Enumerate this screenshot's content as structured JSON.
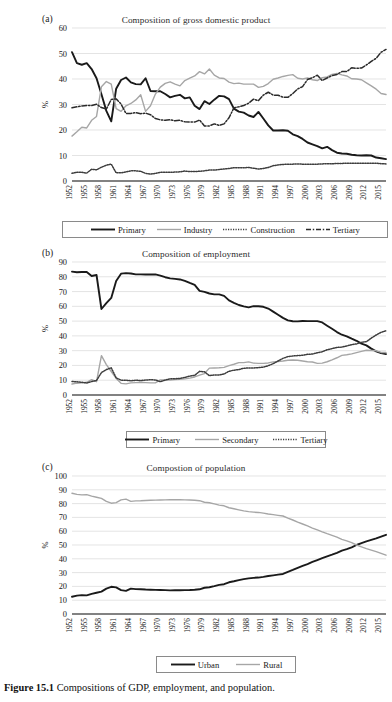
{
  "figure": {
    "caption_label": "Figure 15.1",
    "caption_text": "Compositions of GDP, employment, and population.",
    "axis_percent_label": "%"
  },
  "colors": {
    "primary_line": "#1a1a1a",
    "secondary_line": "#a6a6a6",
    "dotted_line": "#3d3d3d",
    "dashdot_line": "#2b2b2b",
    "gridline": "#d9d9d9",
    "axis": "#595959",
    "background": "#ffffff"
  },
  "panels": [
    {
      "label": "(a)",
      "title": "Composition of gross domestic product",
      "legend": [
        {
          "name": "Primary",
          "style": "solid-black"
        },
        {
          "name": "Industry",
          "style": "solid-gray"
        },
        {
          "name": "Construction",
          "style": "dotted"
        },
        {
          "name": "Tertiary",
          "style": "dash-dot"
        }
      ]
    },
    {
      "label": "(b)",
      "title": "Composition of employment",
      "legend": [
        {
          "name": "Primary",
          "style": "solid-black"
        },
        {
          "name": "Secondary",
          "style": "solid-gray"
        },
        {
          "name": "Tertiary",
          "style": "dotted"
        }
      ]
    },
    {
      "label": "(c)",
      "title": "Compostion of population",
      "legend": [
        {
          "name": "Urban",
          "style": "solid-black"
        },
        {
          "name": "Rural",
          "style": "solid-gray"
        }
      ]
    }
  ],
  "chart_data": [
    {
      "panel": "(a)",
      "type": "line",
      "title": "Composition of gross domestic product",
      "xlabel": "",
      "ylabel": "%",
      "ylim": [
        0,
        60
      ],
      "yticks": [
        0,
        10,
        20,
        30,
        40,
        50,
        60
      ],
      "grid": true,
      "legend_position": "bottom",
      "xtick_labels": [
        "1952",
        "1955",
        "1958",
        "1961",
        "1964",
        "1967",
        "1970",
        "1973",
        "1976",
        "1979",
        "1982",
        "1985",
        "1988",
        "1991",
        "1994",
        "1997",
        "2000",
        "2003",
        "2006",
        "2009",
        "2012",
        "2015"
      ],
      "x": [
        1952,
        1953,
        1954,
        1955,
        1956,
        1957,
        1958,
        1959,
        1960,
        1961,
        1962,
        1963,
        1964,
        1965,
        1966,
        1967,
        1968,
        1969,
        1970,
        1971,
        1972,
        1973,
        1974,
        1975,
        1976,
        1977,
        1978,
        1979,
        1980,
        1981,
        1982,
        1983,
        1984,
        1985,
        1986,
        1987,
        1988,
        1989,
        1990,
        1991,
        1992,
        1993,
        1994,
        1995,
        1996,
        1997,
        1998,
        1999,
        2000,
        2001,
        2002,
        2003,
        2004,
        2005,
        2006,
        2007,
        2008,
        2009,
        2010,
        2011,
        2012,
        2013,
        2014,
        2015,
        2016
      ],
      "series": [
        {
          "name": "Primary",
          "style": "solid-black",
          "values": [
            50.5,
            46.2,
            45.6,
            46.2,
            43.9,
            40.3,
            34.0,
            27.5,
            23.4,
            36.2,
            39.6,
            40.6,
            38.7,
            38.0,
            37.9,
            40.3,
            35.3,
            35.2,
            35.2,
            34.1,
            32.8,
            33.4,
            33.8,
            32.4,
            32.8,
            29.5,
            28.2,
            31.3,
            30.2,
            31.9,
            33.4,
            33.2,
            32.1,
            28.4,
            27.2,
            26.8,
            25.7,
            25.1,
            27.1,
            24.5,
            21.8,
            19.8,
            19.8,
            19.9,
            19.7,
            18.3,
            17.6,
            16.5,
            15.1,
            14.4,
            13.7,
            12.8,
            13.4,
            12.1,
            11.1,
            10.8,
            10.7,
            10.3,
            10.1,
            10.0,
            10.1,
            10.0,
            9.2,
            8.9,
            8.6
          ]
        },
        {
          "name": "Industry",
          "style": "solid-gray",
          "values": [
            17.6,
            19.3,
            21.1,
            20.8,
            23.8,
            25.3,
            37.0,
            39.0,
            38.0,
            28.4,
            27.3,
            29.5,
            30.4,
            31.8,
            33.8,
            27.3,
            29.5,
            34.1,
            36.8,
            38.3,
            38.9,
            38.0,
            37.3,
            39.4,
            40.3,
            41.2,
            42.9,
            42.0,
            43.9,
            41.5,
            40.4,
            40.2,
            38.8,
            38.2,
            38.4,
            38.0,
            38.0,
            38.0,
            36.7,
            37.1,
            38.2,
            39.9,
            40.4,
            41.0,
            41.4,
            41.7,
            40.3,
            40.0,
            40.4,
            39.7,
            39.4,
            40.5,
            40.8,
            41.8,
            42.2,
            41.6,
            41.2,
            40.1,
            40.0,
            39.7,
            38.5,
            37.3,
            36.0,
            34.3,
            33.9
          ]
        },
        {
          "name": "Construction",
          "style": "dotted",
          "values": [
            3.0,
            3.4,
            3.4,
            3.1,
            4.6,
            4.4,
            5.4,
            6.2,
            6.6,
            3.2,
            3.2,
            3.6,
            4.0,
            4.0,
            3.8,
            3.0,
            2.7,
            3.0,
            3.4,
            3.4,
            3.4,
            3.5,
            3.6,
            3.9,
            3.7,
            3.7,
            3.8,
            4.0,
            4.3,
            4.3,
            4.5,
            4.7,
            4.9,
            5.2,
            5.2,
            5.2,
            5.3,
            5.0,
            4.7,
            4.9,
            5.3,
            6.0,
            6.3,
            6.5,
            6.6,
            6.6,
            6.7,
            6.6,
            6.6,
            6.6,
            6.6,
            6.7,
            6.8,
            6.7,
            6.9,
            6.9,
            7.0,
            7.0,
            7.0,
            7.0,
            7.0,
            7.0,
            7.0,
            6.8,
            6.7
          ]
        },
        {
          "name": "Tertiary",
          "style": "dash-dot",
          "values": [
            28.7,
            29.1,
            29.4,
            29.6,
            29.6,
            30.1,
            28.8,
            28.2,
            32.0,
            32.2,
            30.2,
            26.5,
            26.5,
            26.8,
            26.4,
            26.6,
            26.0,
            24.5,
            24.0,
            23.8,
            24.0,
            23.6,
            23.8,
            23.2,
            23.1,
            23.1,
            23.9,
            21.6,
            21.6,
            22.4,
            21.8,
            22.4,
            24.8,
            28.7,
            29.1,
            29.6,
            30.5,
            32.1,
            31.5,
            33.7,
            34.8,
            33.7,
            33.6,
            32.9,
            32.8,
            34.3,
            36.1,
            37.0,
            39.8,
            40.5,
            41.5,
            39.4,
            40.4,
            41.3,
            41.8,
            42.9,
            42.9,
            44.4,
            44.2,
            44.3,
            45.5,
            46.9,
            48.1,
            50.5,
            51.6
          ]
        }
      ]
    },
    {
      "panel": "(b)",
      "type": "line",
      "title": "Composition of employment",
      "xlabel": "",
      "ylabel": "%",
      "ylim": [
        0,
        90
      ],
      "yticks": [
        0,
        10,
        20,
        30,
        40,
        50,
        60,
        70,
        80,
        90
      ],
      "grid": true,
      "legend_position": "bottom",
      "xtick_labels": [
        "1952",
        "1955",
        "1958",
        "1961",
        "1964",
        "1967",
        "1970",
        "1973",
        "1976",
        "1979",
        "1982",
        "1985",
        "1988",
        "1991",
        "1994",
        "1997",
        "2000",
        "2003",
        "2006",
        "2009",
        "2012",
        "2015"
      ],
      "x": [
        1952,
        1953,
        1954,
        1955,
        1956,
        1957,
        1958,
        1959,
        1960,
        1961,
        1962,
        1963,
        1964,
        1965,
        1966,
        1967,
        1968,
        1969,
        1970,
        1971,
        1972,
        1973,
        1974,
        1975,
        1976,
        1977,
        1978,
        1979,
        1980,
        1981,
        1982,
        1983,
        1984,
        1985,
        1986,
        1987,
        1988,
        1989,
        1990,
        1991,
        1992,
        1993,
        1994,
        1995,
        1996,
        1997,
        1998,
        1999,
        2000,
        2001,
        2002,
        2003,
        2004,
        2005,
        2006,
        2007,
        2008,
        2009,
        2010,
        2011,
        2012,
        2013,
        2014,
        2015,
        2016
      ],
      "series": [
        {
          "name": "Primary",
          "style": "solid-black",
          "values": [
            83.5,
            83.1,
            83.2,
            83.3,
            80.5,
            81.2,
            58.2,
            62.2,
            65.7,
            77.2,
            82.1,
            82.5,
            82.2,
            81.6,
            81.6,
            81.5,
            81.5,
            81.6,
            80.8,
            79.7,
            78.9,
            78.6,
            78.2,
            77.2,
            75.8,
            74.5,
            70.5,
            69.8,
            68.7,
            68.1,
            68.1,
            67.1,
            64.0,
            62.4,
            60.9,
            60.0,
            59.3,
            60.1,
            60.1,
            59.7,
            58.5,
            56.4,
            54.3,
            52.2,
            50.5,
            49.9,
            49.8,
            50.1,
            50.0,
            50.0,
            50.0,
            49.1,
            46.9,
            44.8,
            42.6,
            40.8,
            39.6,
            38.1,
            36.7,
            34.8,
            33.6,
            31.4,
            29.5,
            28.3,
            27.7
          ]
        },
        {
          "name": "Secondary",
          "style": "solid-gray",
          "values": [
            7.4,
            8.0,
            8.2,
            8.6,
            10.4,
            9.0,
            26.6,
            20.6,
            15.9,
            11.2,
            7.9,
            7.5,
            8.2,
            8.4,
            8.6,
            8.4,
            8.2,
            8.2,
            10.2,
            10.2,
            10.1,
            10.4,
            10.6,
            10.9,
            11.4,
            12.2,
            13.5,
            14.5,
            18.2,
            18.3,
            18.4,
            18.7,
            19.9,
            20.8,
            21.9,
            21.9,
            22.4,
            21.6,
            21.4,
            21.4,
            21.7,
            22.4,
            22.7,
            23.0,
            23.5,
            23.7,
            23.5,
            23.0,
            22.5,
            22.3,
            21.4,
            21.6,
            22.5,
            23.8,
            25.2,
            26.8,
            27.2,
            27.8,
            28.7,
            29.5,
            30.3,
            30.1,
            29.9,
            28.8,
            28.8
          ]
        },
        {
          "name": "Tertiary",
          "style": "dotted",
          "values": [
            9.1,
            8.9,
            8.6,
            8.1,
            9.1,
            9.8,
            15.2,
            17.2,
            18.4,
            11.6,
            10.0,
            10.0,
            9.6,
            10.0,
            9.8,
            10.1,
            10.3,
            10.2,
            9.0,
            10.1,
            11.0,
            11.0,
            11.2,
            11.9,
            12.8,
            13.3,
            16.0,
            15.7,
            13.1,
            13.6,
            13.5,
            14.2,
            16.1,
            16.8,
            17.2,
            18.1,
            18.3,
            18.3,
            18.5,
            18.9,
            19.8,
            21.2,
            23.0,
            24.8,
            26.0,
            26.4,
            26.7,
            26.9,
            27.5,
            27.7,
            28.6,
            29.3,
            30.6,
            31.4,
            32.2,
            32.4,
            33.2,
            34.1,
            34.6,
            35.7,
            36.1,
            38.5,
            40.6,
            42.4,
            43.5
          ]
        }
      ]
    },
    {
      "panel": "(c)",
      "type": "line",
      "title": "Compostion of population",
      "xlabel": "",
      "ylabel": "%",
      "ylim": [
        0,
        100
      ],
      "yticks": [
        0,
        10,
        20,
        30,
        40,
        50,
        60,
        70,
        80,
        90,
        100
      ],
      "grid": true,
      "legend_position": "bottom",
      "xtick_labels": [
        "1952",
        "1955",
        "1958",
        "1961",
        "1964",
        "1967",
        "1970",
        "1973",
        "1976",
        "1979",
        "1982",
        "1985",
        "1988",
        "1991",
        "1994",
        "1997",
        "2000",
        "2003",
        "2006",
        "2009",
        "2012",
        "2015"
      ],
      "x": [
        1952,
        1953,
        1954,
        1955,
        1956,
        1957,
        1958,
        1959,
        1960,
        1961,
        1962,
        1963,
        1964,
        1965,
        1966,
        1967,
        1968,
        1969,
        1970,
        1971,
        1972,
        1973,
        1974,
        1975,
        1976,
        1977,
        1978,
        1979,
        1980,
        1981,
        1982,
        1983,
        1984,
        1985,
        1986,
        1987,
        1988,
        1989,
        1990,
        1991,
        1992,
        1993,
        1994,
        1995,
        1996,
        1997,
        1998,
        1999,
        2000,
        2001,
        2002,
        2003,
        2004,
        2005,
        2006,
        2007,
        2008,
        2009,
        2010,
        2011,
        2012,
        2013,
        2014,
        2015,
        2016
      ],
      "series": [
        {
          "name": "Urban",
          "style": "solid-black",
          "values": [
            12.5,
            13.3,
            13.7,
            13.5,
            14.6,
            15.4,
            16.2,
            18.4,
            19.7,
            19.3,
            17.3,
            16.8,
            18.4,
            18.0,
            17.9,
            17.7,
            17.6,
            17.5,
            17.4,
            17.3,
            17.1,
            17.2,
            17.2,
            17.3,
            17.4,
            17.6,
            17.9,
            19.0,
            19.4,
            20.2,
            21.1,
            21.6,
            23.0,
            23.7,
            24.5,
            25.3,
            25.8,
            26.2,
            26.4,
            26.9,
            27.5,
            28.0,
            28.5,
            29.0,
            30.5,
            31.9,
            33.4,
            34.8,
            36.2,
            37.7,
            39.1,
            40.5,
            41.8,
            43.0,
            44.3,
            45.9,
            47.0,
            48.3,
            50.0,
            51.3,
            52.6,
            53.7,
            54.8,
            56.1,
            57.4
          ]
        },
        {
          "name": "Rural",
          "style": "solid-gray",
          "values": [
            87.5,
            86.7,
            86.3,
            86.5,
            85.4,
            84.6,
            83.8,
            81.6,
            80.3,
            80.7,
            82.7,
            83.2,
            81.6,
            82.0,
            82.1,
            82.3,
            82.4,
            82.5,
            82.6,
            82.7,
            82.9,
            82.8,
            82.8,
            82.7,
            82.6,
            82.4,
            82.1,
            81.0,
            80.6,
            79.8,
            78.9,
            78.4,
            77.0,
            76.3,
            75.5,
            74.7,
            74.2,
            73.8,
            73.6,
            73.1,
            72.5,
            72.0,
            71.5,
            71.0,
            69.5,
            68.1,
            66.6,
            65.2,
            63.8,
            62.3,
            60.9,
            59.5,
            58.2,
            57.0,
            55.7,
            54.1,
            53.0,
            51.7,
            50.0,
            48.7,
            47.4,
            46.3,
            45.2,
            43.9,
            42.6
          ]
        }
      ]
    }
  ]
}
